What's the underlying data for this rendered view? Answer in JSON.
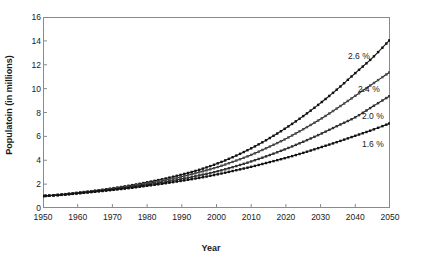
{
  "chart_data": {
    "type": "line",
    "title": "",
    "xlabel": "Year",
    "ylabel": "Populatoin (in millions)",
    "xlim": [
      1950,
      2050
    ],
    "ylim": [
      0,
      16
    ],
    "grid": false,
    "legend_position": "inline-annotations",
    "marker": "square",
    "xticks": [
      1950,
      1960,
      1970,
      1980,
      1990,
      2000,
      2010,
      2020,
      2030,
      2040,
      2050
    ],
    "yticks": [
      0,
      2,
      4,
      6,
      8,
      10,
      12,
      14,
      16
    ],
    "x": [
      1950,
      1955,
      1960,
      1965,
      1970,
      1975,
      1980,
      1985,
      1990,
      1995,
      2000,
      2005,
      2010,
      2015,
      2020,
      2025,
      2030,
      2035,
      2040,
      2045,
      2050
    ],
    "series": [
      {
        "name": "2.6 %",
        "label": "2.6 %",
        "color": "#1a1a1a",
        "growth_rate_percent": 2.6,
        "values": [
          1.0,
          1.12,
          1.28,
          1.45,
          1.65,
          1.88,
          2.15,
          2.45,
          2.8,
          3.2,
          3.7,
          4.3,
          5.0,
          5.8,
          6.7,
          7.7,
          8.8,
          10.0,
          11.3,
          12.6,
          14.1
        ]
      },
      {
        "name": "2.4 %",
        "label": "2.4 %",
        "color": "#1a1a1a",
        "growth_rate_percent": 2.4,
        "values": [
          1.0,
          1.11,
          1.26,
          1.42,
          1.6,
          1.81,
          2.05,
          2.32,
          2.63,
          2.99,
          3.4,
          3.9,
          4.45,
          5.1,
          5.8,
          6.6,
          7.45,
          8.4,
          9.4,
          10.4,
          11.4
        ]
      },
      {
        "name": "2.0 %",
        "label": "2.0 %",
        "color": "#1a1a1a",
        "growth_rate_percent": 2.0,
        "values": [
          1.0,
          1.1,
          1.24,
          1.39,
          1.55,
          1.74,
          1.95,
          2.18,
          2.44,
          2.73,
          3.05,
          3.45,
          3.9,
          4.4,
          4.95,
          5.55,
          6.2,
          6.9,
          7.6,
          8.5,
          9.4
        ]
      },
      {
        "name": "1.6 %",
        "label": "1.6 %",
        "color": "#1a1a1a",
        "growth_rate_percent": 1.6,
        "values": [
          1.0,
          1.09,
          1.22,
          1.36,
          1.51,
          1.67,
          1.86,
          2.06,
          2.28,
          2.52,
          2.8,
          3.12,
          3.45,
          3.82,
          4.2,
          4.62,
          5.08,
          5.55,
          6.05,
          6.55,
          7.1
        ]
      }
    ],
    "annotations": [
      {
        "text": "2.6 %",
        "x_px": 348,
        "y_px": 51
      },
      {
        "text": "2.4 %",
        "x_px": 358,
        "y_px": 84
      },
      {
        "text": "2.0 %",
        "x_px": 362,
        "y_px": 111
      },
      {
        "text": "1.6 %",
        "x_px": 362,
        "y_px": 139
      }
    ]
  }
}
